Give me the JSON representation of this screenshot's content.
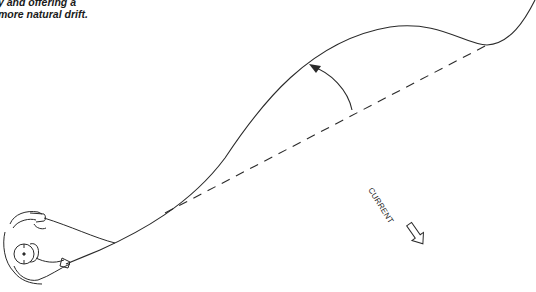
{
  "caption": {
    "line1": "y and offering a",
    "line2": "more natural drift."
  },
  "labels": {
    "current": "CURRENT"
  },
  "icons": {
    "mend_arrow": "curved-arrow-upstream",
    "current_arrow": "hollow-arrow-downstream",
    "angler": "angler-figure-top-view"
  },
  "colors": {
    "ink": "#2a2a2a",
    "background": "#ffffff"
  }
}
